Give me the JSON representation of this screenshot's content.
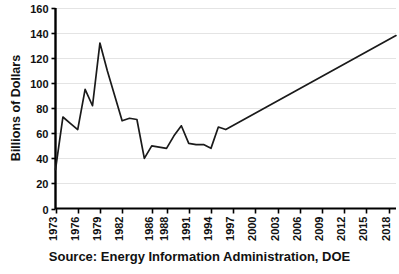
{
  "chart_data": {
    "type": "line",
    "title": "",
    "subtitle": "",
    "xlabel": "",
    "ylabel": "Billions of Dollars",
    "ylim": [
      0,
      160
    ],
    "ytick_values": [
      0,
      20,
      40,
      60,
      80,
      100,
      120,
      140,
      160
    ],
    "ytick_labels": [
      "0",
      "20",
      "40",
      "60",
      "80",
      "100",
      "120",
      "140",
      "160"
    ],
    "xlim": [
      1973,
      2019
    ],
    "xtick_labels": [
      "1973",
      "1976",
      "1979",
      "1982",
      "1986",
      "1988",
      "1991",
      "1994",
      "1997",
      "2000",
      "2003",
      "2006",
      "2009",
      "2012",
      "2015",
      "2018"
    ],
    "xtick_years": [
      1973,
      1976,
      1979,
      1982,
      1986,
      1988,
      1991,
      1994,
      1997,
      2000,
      2003,
      2006,
      2009,
      2012,
      2015,
      2018
    ],
    "grid": "horizontal",
    "legend": "none",
    "line_color": "#1a1a1a",
    "axis_color": "#000000",
    "grid_color": "#e4e4e4",
    "background_color": "#ffffff",
    "x": [
      1973,
      1974,
      1975,
      1976,
      1977,
      1978,
      1979,
      1980,
      1981,
      1982,
      1983,
      1984,
      1985,
      1986,
      1987,
      1988,
      1989,
      1990,
      1991,
      1992,
      1993,
      1994,
      1995,
      1996,
      2019
    ],
    "values": [
      31,
      73,
      68,
      63,
      95,
      82,
      132,
      110,
      90,
      70,
      72,
      71,
      40,
      50,
      49,
      48,
      58,
      66,
      52,
      51,
      51,
      48,
      65,
      63,
      138
    ],
    "series": [
      {
        "name": "Energy expenditures",
        "values": [
          31,
          73,
          68,
          63,
          95,
          82,
          132,
          110,
          90,
          70,
          72,
          71,
          40,
          50,
          49,
          48,
          58,
          66,
          52,
          51,
          51,
          48,
          65,
          63,
          138
        ]
      }
    ],
    "annotations": []
  },
  "caption": {
    "source_text": "Source: Energy Information Administration, DOE"
  },
  "axis": {
    "y_title": "Billions of Dollars"
  }
}
